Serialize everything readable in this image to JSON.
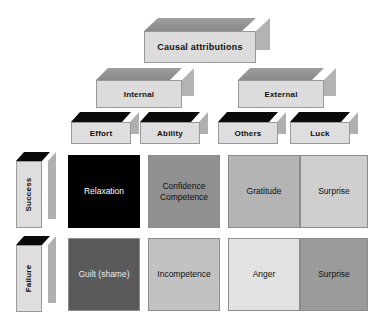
{
  "diagram": {
    "type": "hierarchy-matrix",
    "root": {
      "label": "Causal attributions",
      "box_style": "grey-top-3d"
    },
    "locus_level": [
      {
        "label": "Internal",
        "box_style": "grey-top-3d"
      },
      {
        "label": "External",
        "box_style": "grey-top-3d"
      }
    ],
    "attribution_level": [
      {
        "label": "Effort",
        "locus": "Internal",
        "box_style": "black-top-3d"
      },
      {
        "label": "Ability",
        "locus": "Internal",
        "box_style": "black-top-3d"
      },
      {
        "label": "Others",
        "locus": "External",
        "box_style": "black-top-3d"
      },
      {
        "label": "Luck",
        "locus": "External",
        "box_style": "black-top-3d"
      }
    ],
    "outcome_level": [
      {
        "label": "Success",
        "box_style": "black-top-3d-vertical"
      },
      {
        "label": "Failure",
        "box_style": "black-top-3d-vertical"
      }
    ],
    "matrix": {
      "columns": [
        "Effort",
        "Ability",
        "Others",
        "Luck"
      ],
      "rows": [
        "Success",
        "Failure"
      ],
      "cells": [
        [
          {
            "lines": [
              "Relaxation"
            ],
            "fill": "#000000",
            "text_color": "#ffffff"
          },
          {
            "lines": [
              "Confidence",
              "Competence"
            ],
            "fill": "#909090",
            "text_color": "#101010"
          },
          {
            "lines": [
              "Gratitude"
            ],
            "fill": "#b4b4b4",
            "text_color": "#101010"
          },
          {
            "lines": [
              "Surprise"
            ],
            "fill": "#cfcfcf",
            "text_color": "#101010"
          }
        ],
        [
          {
            "lines": [
              "Guilt (shame)"
            ],
            "fill": "#5a5a5a",
            "text_color": "#e8e8e8"
          },
          {
            "lines": [
              "Incompetence"
            ],
            "fill": "#c2c2c2",
            "text_color": "#101010"
          },
          {
            "lines": [
              "Anger"
            ],
            "fill": "#e2e2e2",
            "text_color": "#101010"
          },
          {
            "lines": [
              "Surprise"
            ],
            "fill": "#9b9b9b",
            "text_color": "#101010"
          }
        ]
      ]
    },
    "colors": {
      "background": "#ffffff",
      "box_face": "#dcdcdc",
      "box_top_grey": "#8f8f8f",
      "box_top_black": "#0a0a0a",
      "box_side": "#b0b0b0",
      "outline": "#8d8d8d"
    }
  }
}
